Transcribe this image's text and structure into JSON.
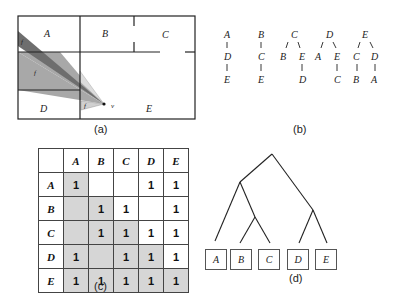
{
  "panel_a": {
    "caption": "(a)",
    "rooms": [
      "A",
      "B",
      "C",
      "D",
      "E"
    ],
    "viewpoint_label": "v",
    "cone_labels": [
      "f",
      "f",
      "f"
    ]
  },
  "panel_b": {
    "caption": "(b)",
    "trees": [
      {
        "root": "A",
        "rows": [
          [
            "D"
          ],
          [
            "E"
          ]
        ]
      },
      {
        "root": "B",
        "rows": [
          [
            "C"
          ],
          [
            "E"
          ]
        ]
      },
      {
        "root": "C",
        "rows": [
          [
            "B",
            "E"
          ],
          [
            "D"
          ]
        ]
      },
      {
        "root": "D",
        "rows": [
          [
            "A",
            "E"
          ],
          [
            "C"
          ]
        ]
      },
      {
        "root": "E",
        "rows": [
          [
            "C",
            "D"
          ],
          [
            "B",
            "A"
          ]
        ]
      }
    ]
  },
  "panel_c": {
    "caption": "(c)",
    "headers": [
      "A",
      "B",
      "C",
      "D",
      "E"
    ],
    "rows": [
      {
        "label": "A",
        "cells": [
          "1",
          "",
          "",
          "1",
          "1"
        ]
      },
      {
        "label": "B",
        "cells": [
          "",
          "1",
          "1",
          "",
          "1"
        ]
      },
      {
        "label": "C",
        "cells": [
          "",
          "1",
          "1",
          "1",
          "1"
        ]
      },
      {
        "label": "D",
        "cells": [
          "1",
          "",
          "1",
          "1",
          "1"
        ]
      },
      {
        "label": "E",
        "cells": [
          "1",
          "1",
          "1",
          "1",
          "1"
        ]
      }
    ],
    "shade_color": "#d6d6d6"
  },
  "panel_d": {
    "caption": "(d)",
    "leaves": [
      "A",
      "B",
      "C",
      "D",
      "E"
    ]
  }
}
